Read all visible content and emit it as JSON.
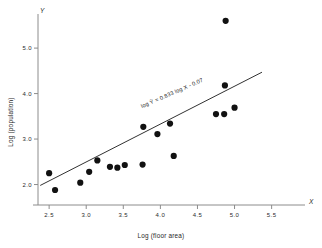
{
  "chart_data": {
    "type": "scatter",
    "title": "",
    "xlabel": "Log (floor area)",
    "ylabel": "Log (population)",
    "x_axis_letter": "X",
    "y_axis_letter": "Y",
    "xlim": [
      2.35,
      5.95
    ],
    "ylim": [
      1.55,
      5.75
    ],
    "xticks": [
      2.5,
      3.0,
      3.5,
      4.0,
      4.5,
      5.0,
      5.5
    ],
    "xtick_labels": [
      "2.5",
      "3.0",
      "3.5",
      "4.0",
      "4.5",
      "5.0",
      "5.5"
    ],
    "yticks": [
      2.0,
      3.0,
      4.0,
      5.0
    ],
    "ytick_labels": [
      "2.0",
      "3.0",
      "4.0",
      "5.0"
    ],
    "grid": false,
    "legend": "none",
    "marker_color": "#111111",
    "line_color": "#1a1a1a",
    "axis_color": "#8c8c8c",
    "points": [
      {
        "x": 2.5,
        "y": 2.25
      },
      {
        "x": 2.58,
        "y": 1.88
      },
      {
        "x": 2.92,
        "y": 2.04
      },
      {
        "x": 3.04,
        "y": 2.28
      },
      {
        "x": 3.15,
        "y": 2.53
      },
      {
        "x": 3.32,
        "y": 2.39
      },
      {
        "x": 3.42,
        "y": 2.37
      },
      {
        "x": 3.52,
        "y": 2.43
      },
      {
        "x": 3.76,
        "y": 2.44
      },
      {
        "x": 3.77,
        "y": 3.27
      },
      {
        "x": 3.96,
        "y": 3.11
      },
      {
        "x": 4.13,
        "y": 3.34
      },
      {
        "x": 4.18,
        "y": 2.63
      },
      {
        "x": 4.75,
        "y": 3.55
      },
      {
        "x": 4.86,
        "y": 3.55
      },
      {
        "x": 4.87,
        "y": 4.18
      },
      {
        "x": 4.88,
        "y": 5.6
      },
      {
        "x": 5.0,
        "y": 3.69
      }
    ],
    "fit_line": {
      "equation_label": "log Ŷ = 0.833 log X - 0.07",
      "slope": 0.833,
      "intercept": -0.07,
      "x_start": 2.38,
      "y_start": 1.98,
      "x_end": 5.37,
      "y_end": 4.47
    }
  }
}
